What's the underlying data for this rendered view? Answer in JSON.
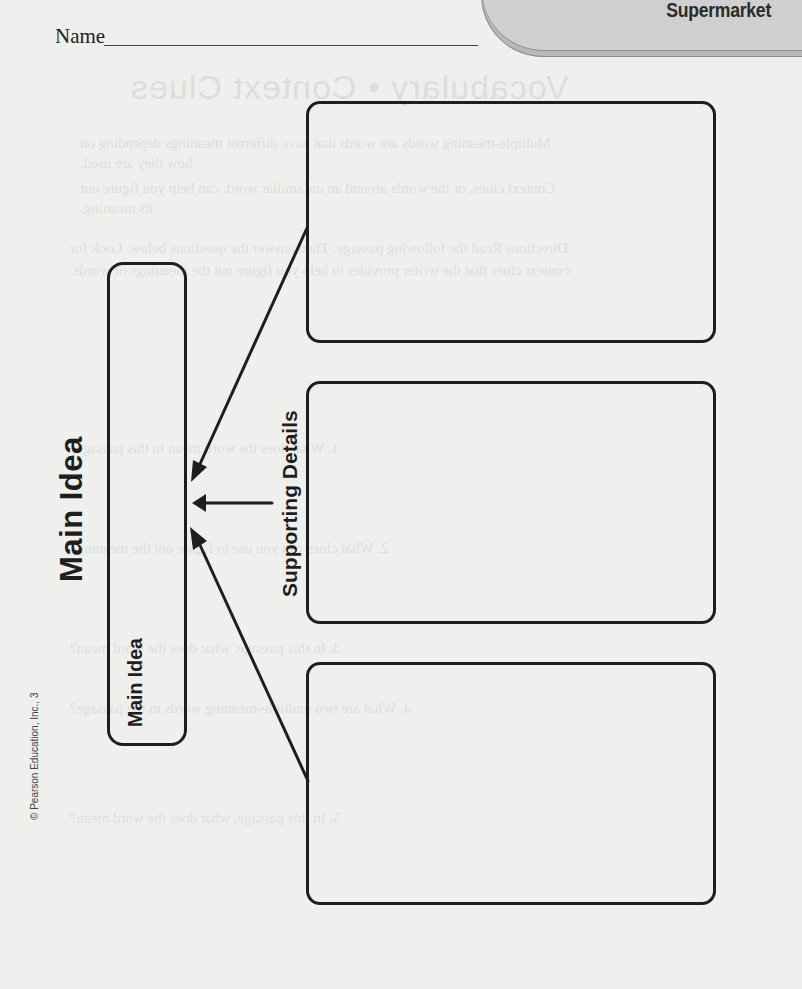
{
  "header": {
    "name_label": "Name",
    "tab_label": "Supermarket"
  },
  "organizer": {
    "main_idea_heading": "Main Idea",
    "supporting_details_heading": "Supporting Details",
    "main_idea_box_label": "Main Idea",
    "main_idea_box_value": "",
    "detail_boxes": [
      {
        "value": ""
      },
      {
        "value": ""
      },
      {
        "value": ""
      }
    ]
  },
  "footer": {
    "copyright": "© Pearson Education, Inc., 3"
  },
  "bleed_through": {
    "title": "Vocabulary • Context Clues",
    "lines": [
      "Multiple-meaning words are words that have different meanings depending on",
      "how they are used.",
      "Context clues, or the words around an unfamiliar word, can help you figure out",
      "its meaning.",
      "Directions Read the following passage. Then answer the questions below. Look for",
      "context clues that the writer provides to help you figure out the meanings of words.",
      "1. What does the word mean in this passage?",
      "2. What clues can you use to figure out the meaning?",
      "3. In this passage, what does the word mean?",
      "4. What are two multiple-meaning words in the passage?",
      "5. In this passage, what does the word mean?"
    ]
  },
  "colors": {
    "page_background": "#efefed",
    "outline": "#1e1e1e",
    "tab_fill": "#cfcfcf",
    "tab_border": "#8a8a8a"
  }
}
